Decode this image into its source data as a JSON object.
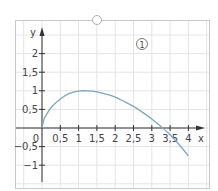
{
  "panel": {
    "marker": "1"
  },
  "chart_data": {
    "type": "line",
    "title": "",
    "marker_label": "1",
    "xlabel": "x",
    "ylabel": "y",
    "xlim": [
      0,
      4.3
    ],
    "ylim": [
      -1.4,
      2.6
    ],
    "grid": true,
    "x_ticks": [
      {
        "v": 0.5,
        "label": "0,5"
      },
      {
        "v": 1,
        "label": "1"
      },
      {
        "v": 1.5,
        "label": "1,5"
      },
      {
        "v": 2,
        "label": "2"
      },
      {
        "v": 2.5,
        "label": "2,5"
      },
      {
        "v": 3,
        "label": "3"
      },
      {
        "v": 3.5,
        "label": "3,5"
      },
      {
        "v": 4,
        "label": "4"
      }
    ],
    "y_ticks": [
      {
        "v": 2,
        "label": "2"
      },
      {
        "v": 1.5,
        "label": "1,5"
      },
      {
        "v": 1,
        "label": "1"
      },
      {
        "v": 0.5,
        "label": "0,5"
      },
      {
        "v": -0.5,
        "label": "−0,5"
      },
      {
        "v": -1,
        "label": "−1"
      }
    ],
    "origin_label": "0",
    "series": [
      {
        "name": "f",
        "color": "#7ba7c7",
        "x": [
          0,
          0.05,
          0.1,
          0.25,
          0.5,
          0.75,
          1,
          1.25,
          1.5,
          1.75,
          2,
          2.25,
          2.5,
          2.75,
          3,
          3.25,
          3.5,
          3.75,
          4
        ],
        "y": [
          0,
          0.22,
          0.32,
          0.55,
          0.78,
          0.93,
          0.99,
          1.0,
          0.97,
          0.91,
          0.83,
          0.71,
          0.58,
          0.42,
          0.24,
          0.04,
          -0.18,
          -0.45,
          -0.75
        ]
      }
    ]
  }
}
